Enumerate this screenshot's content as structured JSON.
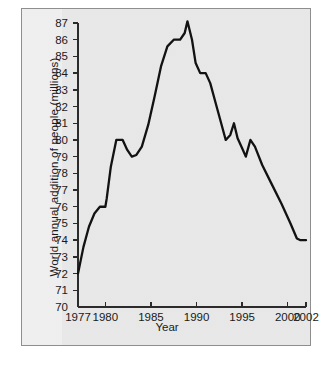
{
  "figure": {
    "panel_bg": "#ececec",
    "border_color": "#8e8e8e",
    "line_color": "#121212",
    "axis_color": "#2b2b2b"
  },
  "chart_data": {
    "type": "line",
    "title": "",
    "xlabel": "Year",
    "ylabel": "World annual addition of people (millions)",
    "xlim": [
      1977,
      2002
    ],
    "ylim": [
      70,
      87
    ],
    "grid": false,
    "legend": null,
    "x_ticks": [
      1977,
      1980,
      1985,
      1990,
      1995,
      2000,
      2002
    ],
    "x_tick_labels": [
      "1977",
      "1980",
      "1985",
      "1990",
      "1995",
      "2000",
      "2002"
    ],
    "y_ticks": [
      70,
      71,
      72,
      73,
      74,
      75,
      76,
      77,
      78,
      79,
      80,
      81,
      82,
      83,
      84,
      85,
      86,
      87
    ],
    "y_tick_labels": [
      "70",
      "71",
      "72",
      "73",
      "74",
      "75",
      "76",
      "77",
      "78",
      "79",
      "80",
      "81",
      "82",
      "83",
      "84",
      "85",
      "86",
      "87"
    ],
    "series": [
      {
        "name": "World annual addition of people",
        "x": [
          1977,
          1977.6,
          1978.2,
          1978.8,
          1979.4,
          1980.0,
          1980.15,
          1980.6,
          1981.2,
          1981.9,
          1982.4,
          1982.9,
          1983.4,
          1984.0,
          1984.7,
          1985.4,
          1986.1,
          1986.8,
          1987.5,
          1988.2,
          1988.7,
          1989.0,
          1989.5,
          1989.9,
          1990.4,
          1991.0,
          1991.5,
          1992.1,
          1992.7,
          1993.2,
          1993.7,
          1994.1,
          1994.5,
          1995.0,
          1995.4,
          1995.9,
          1996.4,
          1997.2,
          1998.2,
          1999.3,
          2000.3,
          2001.0,
          2001.4,
          2002.0
        ],
        "y": [
          72.0,
          73.6,
          74.8,
          75.6,
          76.0,
          76.0,
          76.5,
          78.4,
          80.0,
          80.0,
          79.4,
          79.0,
          79.1,
          79.6,
          80.9,
          82.6,
          84.4,
          85.6,
          86.0,
          86.0,
          86.4,
          87.1,
          86.0,
          84.6,
          84.0,
          84.0,
          83.4,
          82.2,
          81.0,
          80.0,
          80.3,
          81.0,
          80.1,
          79.5,
          79.0,
          80.0,
          79.6,
          78.5,
          77.4,
          76.2,
          75.0,
          74.1,
          74.0,
          74.0
        ]
      }
    ],
    "annotations": {
      "start_value": 72,
      "peak_value": 87,
      "peak_year": 1989,
      "end_value": 74
    }
  }
}
